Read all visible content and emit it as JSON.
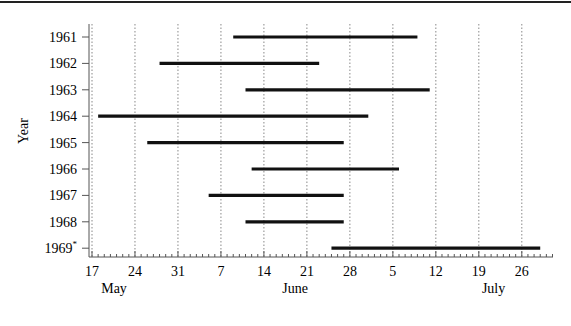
{
  "chart_data": {
    "type": "bar",
    "orientation": "horizontal-range",
    "title": "",
    "xlabel": "",
    "ylabel": "Year",
    "grid": {
      "x": true,
      "y": false,
      "style": "dotted"
    },
    "legend": null,
    "x_axis": {
      "start": "17 May",
      "end": "~1 Aug",
      "ticks": [
        {
          "label": "17",
          "day": 0
        },
        {
          "label": "24",
          "day": 7
        },
        {
          "label": "31",
          "day": 14
        },
        {
          "label": "7",
          "day": 21
        },
        {
          "label": "14",
          "day": 28
        },
        {
          "label": "21",
          "day": 35
        },
        {
          "label": "28",
          "day": 42
        },
        {
          "label": "5",
          "day": 49
        },
        {
          "label": "12",
          "day": 56
        },
        {
          "label": "19",
          "day": 63
        },
        {
          "label": "26",
          "day": 70
        }
      ],
      "months": [
        {
          "label": "May",
          "day": 1.5
        },
        {
          "label": "June",
          "day": 31
        },
        {
          "label": "July",
          "day": 63.5
        }
      ],
      "max_day": 75
    },
    "categories": [
      "1961",
      "1962",
      "1963",
      "1964",
      "1965",
      "1966",
      "1967",
      "1968",
      "1969*"
    ],
    "series": [
      {
        "year": "1961",
        "start": "9 Jun",
        "end": "9 Jul",
        "start_day": 23,
        "end_day": 53
      },
      {
        "year": "1962",
        "start": "28 May",
        "end": "23 Jun",
        "start_day": 11,
        "end_day": 37
      },
      {
        "year": "1963",
        "start": "11 Jun",
        "end": "11 Jul",
        "start_day": 25,
        "end_day": 55
      },
      {
        "year": "1964",
        "start": "18 May",
        "end": "1 Jul",
        "start_day": 1,
        "end_day": 45
      },
      {
        "year": "1965",
        "start": "26 May",
        "end": "27 Jun",
        "start_day": 9,
        "end_day": 41
      },
      {
        "year": "1966",
        "start": "12 Jun",
        "end": "6 Jul",
        "start_day": 26,
        "end_day": 50
      },
      {
        "year": "1967",
        "start": "5 Jun",
        "end": "27 Jun",
        "start_day": 19,
        "end_day": 41
      },
      {
        "year": "1968",
        "start": "11 Jun",
        "end": "27 Jun",
        "start_day": 25,
        "end_day": 41
      },
      {
        "year": "1969",
        "label": "1969*",
        "start": "25 Jun",
        "end": "29 Jul",
        "start_day": 39,
        "end_day": 73
      }
    ],
    "annotations": [
      "asterisk on 1969"
    ]
  }
}
